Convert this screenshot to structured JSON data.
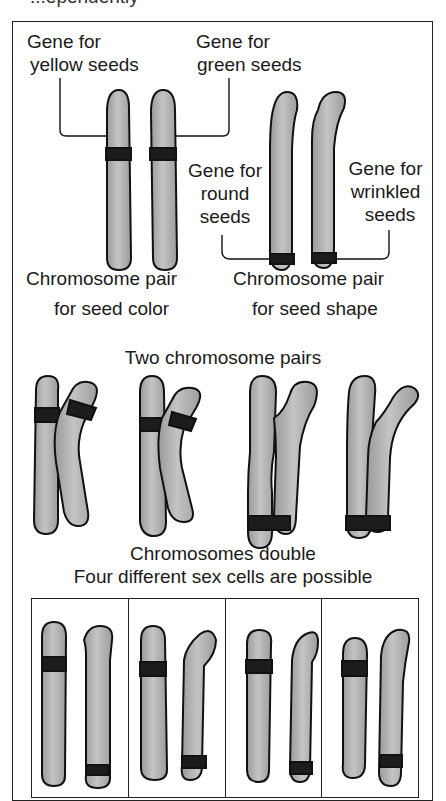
{
  "header_fragment": "...ependently",
  "panel_top": {
    "label_yellow": [
      "Gene for",
      "yellow seeds"
    ],
    "label_green": [
      "Gene for",
      "green seeds"
    ],
    "label_round": [
      "Gene for",
      "round",
      "seeds"
    ],
    "label_wrinkled": [
      "Gene for",
      "wrinkled",
      "seeds"
    ],
    "caption_color": [
      "Chromosome pair",
      "for seed color"
    ],
    "caption_shape": [
      "Chromosome pair",
      "for seed shape"
    ]
  },
  "panel_middle": {
    "title": "Two chromosome pairs",
    "caption": "Chromosomes double"
  },
  "panel_bottom": {
    "title": "Four different sex cells are possible",
    "cells": [
      "yellow-round",
      "yellow-wrinkled",
      "green-round",
      "green-wrinkled"
    ]
  },
  "colors": {
    "chromosome_fill": "#a9a9a9",
    "gene_band": "#1c1c1c",
    "outline": "#111111"
  }
}
